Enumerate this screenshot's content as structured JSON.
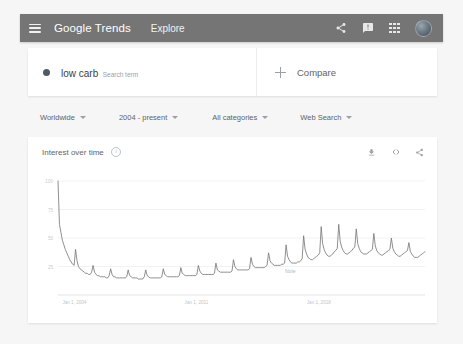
{
  "appbar": {
    "menu_icon": "hamburger-icon",
    "brand_part1": "Google",
    "brand_part2": " Trends",
    "explore": "Explore",
    "share_icon": "share-icon",
    "feedback_icon": "feedback-icon",
    "apps_icon": "apps-grid-icon",
    "avatar": "user-avatar",
    "background": "#757575"
  },
  "term": {
    "name": "low carb",
    "subtitle": "Search term",
    "dot_color": "#4f5b63",
    "compare_label": "Compare"
  },
  "filters": [
    {
      "label": "Worldwide"
    },
    {
      "label": "2004 - present"
    },
    {
      "label": "All categories"
    },
    {
      "label": "Web Search"
    }
  ],
  "chart": {
    "title": "Interest over time",
    "info_icon": "info-icon",
    "download_icon": "download-icon",
    "embed_icon": "embed-code-icon",
    "share_icon": "share-icon",
    "note_label": "Note",
    "line_color": "#7b7b7b"
  },
  "chart_data": {
    "type": "line",
    "title": "Interest over time",
    "xlabel": "",
    "ylabel": "",
    "ylim": [
      0,
      100
    ],
    "grid": true,
    "legend": false,
    "yticks": [
      100,
      75,
      50,
      25
    ],
    "xticks": [
      "Jan 1, 2004",
      "Jan 1, 2011",
      "Jan 1, 2018"
    ],
    "annotations": [
      {
        "text": "Note",
        "x": 0.63,
        "y": 0
      }
    ],
    "series": [
      {
        "name": "low carb",
        "values": [
          100,
          62,
          55,
          48,
          44,
          40,
          37,
          34,
          31,
          29,
          27,
          26,
          40,
          30,
          25,
          23,
          22,
          21,
          20,
          19,
          19,
          18,
          18,
          20,
          26,
          20,
          18,
          17,
          17,
          16,
          16,
          16,
          16,
          15,
          15,
          17,
          23,
          18,
          16,
          16,
          15,
          15,
          15,
          15,
          15,
          15,
          15,
          16,
          22,
          17,
          16,
          15,
          15,
          15,
          15,
          14,
          14,
          14,
          14,
          16,
          22,
          17,
          16,
          15,
          15,
          15,
          15,
          15,
          15,
          15,
          15,
          16,
          23,
          18,
          17,
          16,
          16,
          16,
          16,
          16,
          16,
          16,
          16,
          17,
          24,
          19,
          18,
          17,
          17,
          17,
          17,
          17,
          17,
          17,
          17,
          18,
          26,
          21,
          19,
          18,
          18,
          18,
          18,
          18,
          18,
          18,
          18,
          19,
          28,
          22,
          21,
          20,
          20,
          20,
          20,
          20,
          20,
          20,
          20,
          21,
          31,
          25,
          23,
          22,
          22,
          22,
          22,
          22,
          22,
          22,
          22,
          23,
          33,
          27,
          25,
          24,
          24,
          24,
          24,
          24,
          24,
          24,
          25,
          26,
          37,
          30,
          28,
          27,
          26,
          26,
          26,
          26,
          26,
          27,
          27,
          28,
          44,
          34,
          31,
          29,
          28,
          28,
          28,
          28,
          29,
          29,
          30,
          32,
          52,
          40,
          36,
          33,
          32,
          31,
          31,
          32,
          33,
          34,
          35,
          37,
          60,
          45,
          40,
          37,
          35,
          34,
          34,
          35,
          36,
          38,
          39,
          41,
          62,
          47,
          42,
          39,
          37,
          36,
          36,
          37,
          38,
          39,
          41,
          42,
          58,
          45,
          41,
          38,
          37,
          36,
          36,
          36,
          37,
          38,
          39,
          40,
          54,
          43,
          39,
          37,
          36,
          35,
          35,
          36,
          37,
          38,
          39,
          40,
          50,
          41,
          38,
          36,
          35,
          34,
          34,
          35,
          36,
          37,
          38,
          39,
          46,
          38,
          36,
          34,
          33,
          33,
          33,
          34,
          35,
          36,
          37,
          38
        ]
      }
    ]
  }
}
